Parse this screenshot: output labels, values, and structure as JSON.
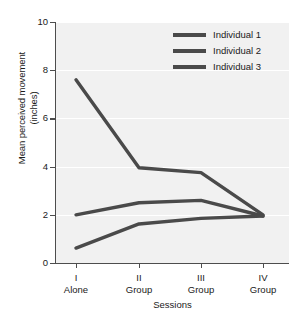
{
  "chart_data": {
    "type": "line",
    "title": "",
    "xlabel": "Sessions",
    "ylabel": "Mean perceived movement (inches)",
    "ylabel_line1": "Mean perceived movement",
    "ylabel_line2": "(inches)",
    "categories": [
      "I",
      "II",
      "III",
      "IV"
    ],
    "category_conditions": [
      "Alone",
      "Group",
      "Group",
      "Group"
    ],
    "x_tick_labels": [
      {
        "roman": "I",
        "condition": "Alone"
      },
      {
        "roman": "II",
        "condition": "Group"
      },
      {
        "roman": "III",
        "condition": "Group"
      },
      {
        "roman": "IV",
        "condition": "Group"
      }
    ],
    "ylim": [
      0,
      10
    ],
    "y_ticks": [
      0,
      2,
      4,
      6,
      8,
      10
    ],
    "y_tick_labels": [
      "0",
      "2",
      "4",
      "6",
      "8",
      "10"
    ],
    "grid": true,
    "legend_position": "top-right",
    "series": [
      {
        "name": "Individual 1",
        "values": [
          7.6,
          3.95,
          3.75,
          2.0
        ],
        "color": "#4a4a4a"
      },
      {
        "name": "Individual 2",
        "values": [
          2.0,
          2.5,
          2.6,
          1.95
        ],
        "color": "#4a4a4a"
      },
      {
        "name": "Individual 3",
        "values": [
          0.62,
          1.62,
          1.85,
          1.95
        ],
        "color": "#4a4a4a"
      }
    ]
  },
  "legend": {
    "items": [
      {
        "label": "Individual 1"
      },
      {
        "label": "Individual 2"
      },
      {
        "label": "Individual 3"
      }
    ]
  },
  "colors": {
    "line": "#4a4a4a",
    "axis": "#4d4d4d",
    "plot_background": "#f1f1f1",
    "gridline": "#ffffff",
    "text": "#1a1a1a"
  }
}
